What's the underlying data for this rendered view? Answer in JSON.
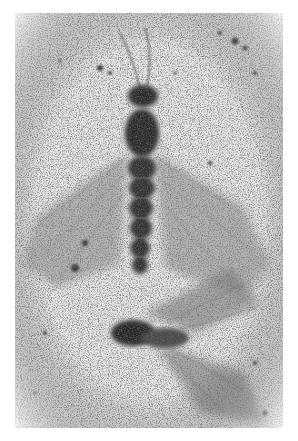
{
  "figure": {
    "colors": {
      "matrix": "#e4e4e4",
      "fossil_dark": "#2a2a2a",
      "wing_shade": "#9a9a9a",
      "background": "#ffffff"
    }
  },
  "caption": {
    "text": "",
    "note": "truncated at bottom edge"
  }
}
